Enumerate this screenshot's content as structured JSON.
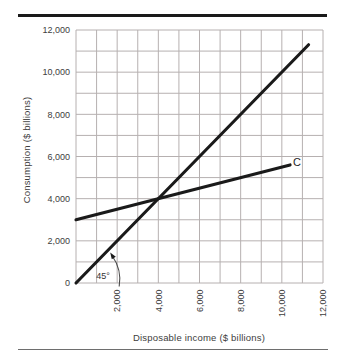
{
  "chart_data": {
    "type": "line",
    "title": "",
    "xlabel": "Disposable income ($ billions)",
    "ylabel": "Consumption ($ billions)",
    "xlim": [
      0,
      12000
    ],
    "ylim": [
      0,
      12000
    ],
    "grid_step": 1000,
    "grid_on": true,
    "x_ticks": [
      2000,
      4000,
      6000,
      8000,
      10000,
      12000
    ],
    "x_tick_labels": [
      "2,000",
      "4,000",
      "6,000",
      "8,000",
      "10,000",
      "12,000"
    ],
    "y_ticks": [
      0,
      2000,
      4000,
      6000,
      8000,
      10000,
      12000
    ],
    "y_tick_labels": [
      "0",
      "2,000",
      "4,000",
      "6,000",
      "8,000",
      "10,000",
      "12,000"
    ],
    "series": [
      {
        "name": "45-degree reference line",
        "label": "",
        "points": [
          [
            0,
            0
          ],
          [
            11300,
            11300
          ]
        ]
      },
      {
        "name": "consumption function",
        "label": "C",
        "intercept": 3000,
        "slope": 0.25,
        "points": [
          [
            0,
            3000
          ],
          [
            10400,
            5600
          ]
        ]
      }
    ],
    "intersection": [
      4000,
      4000
    ],
    "annotations": [
      {
        "text": "45°",
        "target": "angle between x-axis and 45-degree line"
      }
    ],
    "colors": {
      "line": "#1a1a1a",
      "grid": "#b6b0b0",
      "text": "#3d3d3d",
      "rule_top": "#1a1a1a",
      "rule_bottom": "#6e6e6e"
    }
  }
}
